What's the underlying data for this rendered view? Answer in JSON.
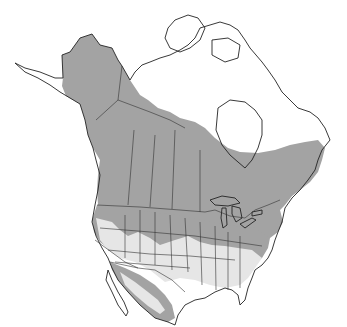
{
  "map": {
    "type": "species-range-map",
    "region": "North America",
    "colors": {
      "background": "#ffffff",
      "range_primary": "#a3a3a3",
      "range_secondary": "#e6e6e6",
      "outside_range": "#ffffff",
      "borders": "#222222",
      "water": "#ffffff"
    },
    "legend": null,
    "labels": []
  }
}
